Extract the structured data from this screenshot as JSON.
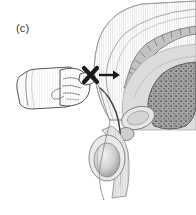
{
  "figure": {
    "panel_label": "(c)",
    "type": "medical-anatomical-illustration",
    "style": "grayscale line drawing with stipple shading",
    "background_color": "#ffffff"
  },
  "annotations": {
    "cross_mark": {
      "symbol": "X",
      "color": "#1a1a1a",
      "meaning": "incorrect-technique-marker"
    },
    "arrow": {
      "symbol": "→",
      "direction": "right",
      "color": "#1a1a1a",
      "meaning": "direction-of-insertion"
    }
  },
  "elements": {
    "gloved_hand": {
      "name": "gloved hand with extended index finger",
      "outline_color": "#4a4a4a",
      "fill_color": "#fdfdfd"
    },
    "anatomy": {
      "name": "male pelvis sagittal cross-section",
      "parts": [
        "sacrum",
        "vertebrae",
        "rectum",
        "bladder",
        "prostate",
        "penis",
        "testicle",
        "scrotum"
      ],
      "outline_color": "#6b6b6b",
      "tissue_fill": "#d4d4d4",
      "dark_tissue_fill": "#8a8a8a",
      "light_fill": "#efefef"
    }
  }
}
